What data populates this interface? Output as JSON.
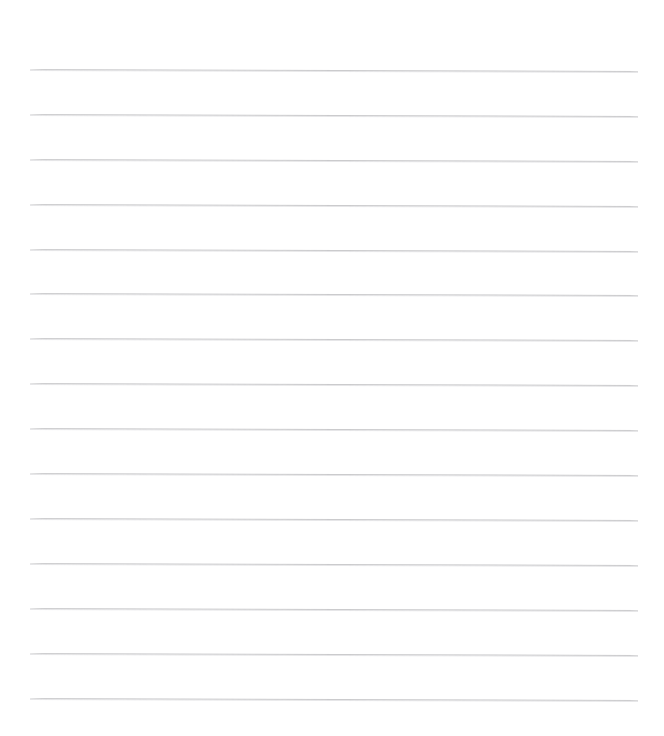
{
  "document": {
    "kind": "blank-ruled-paper",
    "title": "Blank Ruled Paper",
    "background_color": "#ffffff",
    "page_width": 664,
    "page_height": 736,
    "content_text": "",
    "has_text": false,
    "has_margin_rule": false,
    "has_header": false,
    "has_footer": false
  },
  "ruling": {
    "line_color": "#c9c9cb",
    "line_thickness_px": 1,
    "line_count": 15,
    "line_left_px": 30,
    "line_right_px": 638,
    "line_width_px": 608,
    "first_line_y_px": 69,
    "line_spacing_px": 45,
    "skew_drop_px": 2,
    "lines": [
      {
        "index": 1,
        "y": 69,
        "left": 30,
        "width": 608
      },
      {
        "index": 2,
        "y": 114,
        "left": 30,
        "width": 608
      },
      {
        "index": 3,
        "y": 159,
        "left": 30,
        "width": 608
      },
      {
        "index": 4,
        "y": 204,
        "left": 30,
        "width": 608
      },
      {
        "index": 5,
        "y": 249,
        "left": 30,
        "width": 608
      },
      {
        "index": 6,
        "y": 293,
        "left": 30,
        "width": 608
      },
      {
        "index": 7,
        "y": 338,
        "left": 30,
        "width": 608
      },
      {
        "index": 8,
        "y": 383,
        "left": 30,
        "width": 608
      },
      {
        "index": 9,
        "y": 428,
        "left": 30,
        "width": 608
      },
      {
        "index": 10,
        "y": 473,
        "left": 30,
        "width": 608
      },
      {
        "index": 11,
        "y": 518,
        "left": 30,
        "width": 608
      },
      {
        "index": 12,
        "y": 563,
        "left": 30,
        "width": 608
      },
      {
        "index": 13,
        "y": 608,
        "left": 30,
        "width": 608
      },
      {
        "index": 14,
        "y": 653,
        "left": 30,
        "width": 608
      },
      {
        "index": 15,
        "y": 698,
        "left": 30,
        "width": 608
      }
    ]
  }
}
